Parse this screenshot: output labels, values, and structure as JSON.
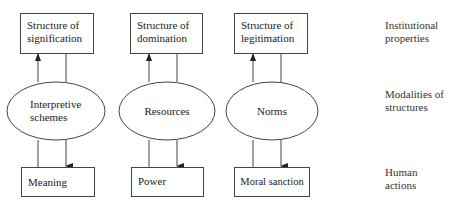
{
  "columns": [
    {
      "structure": [
        "Structure of",
        "signification"
      ],
      "modality": [
        "Interpretive",
        "schemes"
      ],
      "action": "Meaning"
    },
    {
      "structure": [
        "Structure of",
        "domination"
      ],
      "modality": [
        "Resources"
      ],
      "action": "Power"
    },
    {
      "structure": [
        "Structure of",
        "legitimation"
      ],
      "modality": [
        "Norms"
      ],
      "action": "Moral sanction"
    }
  ],
  "row_labels": {
    "top": [
      "Institutional",
      "properties"
    ],
    "middle": [
      "Modalities of",
      "structures"
    ],
    "bottom": [
      "Human",
      "actions"
    ]
  },
  "colors": {
    "line": "#444444",
    "text": "#222222"
  }
}
